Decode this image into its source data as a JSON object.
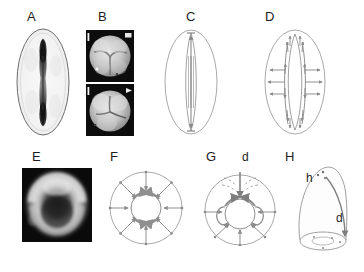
{
  "figure": {
    "type": "multi-panel-scientific-figure",
    "panel_count": 8,
    "width": 364,
    "height": 272,
    "background_color": "#ffffff",
    "ink_color": "#6b6b6b",
    "label_color": "#1d1d1d"
  },
  "labels": {
    "a": "A",
    "b": "B",
    "c": "C",
    "d": "D",
    "e": "E",
    "f": "F",
    "g": "G",
    "h": "H"
  },
  "annotations": {
    "g_d": "d",
    "h_h": "h",
    "h_d": "d"
  },
  "panels": {
    "a": {
      "label": "A",
      "kind": "micrograph-light",
      "description": "Ovoid embryo outline in light field with dark elongated central furrow"
    },
    "b": {
      "label": "B",
      "kind": "micrograph-dark-pair",
      "description": "Two stacked scanning electron micrographs of cleaving embryos on black background"
    },
    "c": {
      "label": "C",
      "kind": "diagram",
      "description": "Ovoid outline with narrow central lens and vertical bidirectional arrows"
    },
    "d": {
      "label": "D",
      "kind": "diagram",
      "description": "Ovoid outline with central lens flanked by two vertical arrow chains and outward horizontal arrows"
    },
    "e": {
      "label": "E",
      "kind": "micrograph-fluorescence",
      "description": "Dark fluorescence micrograph showing bright ring of cortical signal"
    },
    "f": {
      "label": "F",
      "kind": "diagram",
      "description": "Circle with inner ring, eight radial inward arrows and curved arrows around the ring"
    },
    "g": {
      "label": "G",
      "kind": "diagram",
      "description": "Circle with inner ring, radial arrows, dashed converging lines and a downward arrow marked d"
    },
    "h": {
      "label": "H",
      "kind": "diagram-3d",
      "description": "Three dimensional dome with elliptical base, label h at apex and curved arrow d down the side"
    }
  }
}
